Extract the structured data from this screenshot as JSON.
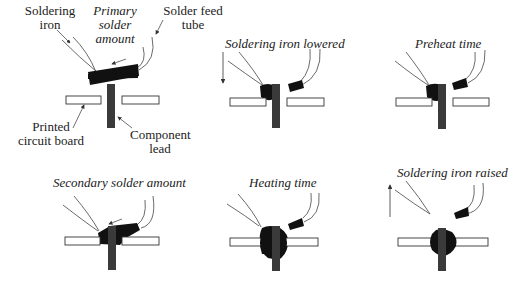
{
  "diagram": {
    "type": "process-sequence",
    "colors": {
      "solder": "#111111",
      "lead": "#3a3a3a",
      "board_fill": "#ffffff",
      "line": "#333333"
    }
  },
  "panels": [
    {
      "id": "overview",
      "labels": {
        "soldering_iron_1": "Soldering",
        "soldering_iron_2": "iron",
        "primary_1": "Primary",
        "primary_2": "solder",
        "primary_3": "amount",
        "feed_1": "Solder feed",
        "feed_2": "tube",
        "pcb_1": "Printed",
        "pcb_2": "circuit board",
        "lead_1": "Component",
        "lead_2": "lead"
      }
    },
    {
      "id": "lowered",
      "title": "Soldering iron lowered"
    },
    {
      "id": "preheat",
      "title": "Preheat time"
    },
    {
      "id": "secondary",
      "title": "Secondary solder amount"
    },
    {
      "id": "heating",
      "title": "Heating time"
    },
    {
      "id": "raised",
      "title": "Soldering iron raised"
    }
  ]
}
